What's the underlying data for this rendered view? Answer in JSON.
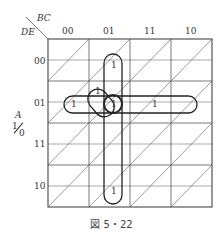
{
  "diagram": {
    "row_var": "DE",
    "col_var": "BC",
    "cell_var": "A",
    "cell_var_top": "1",
    "cell_var_bottom": "0",
    "col_labels": [
      "00",
      "01",
      "11",
      "10"
    ],
    "row_labels": [
      "00",
      "01",
      "11",
      "10"
    ],
    "ones": [
      "1",
      "1",
      "1",
      "1",
      "1",
      "1"
    ],
    "caption": "図 5・22"
  }
}
